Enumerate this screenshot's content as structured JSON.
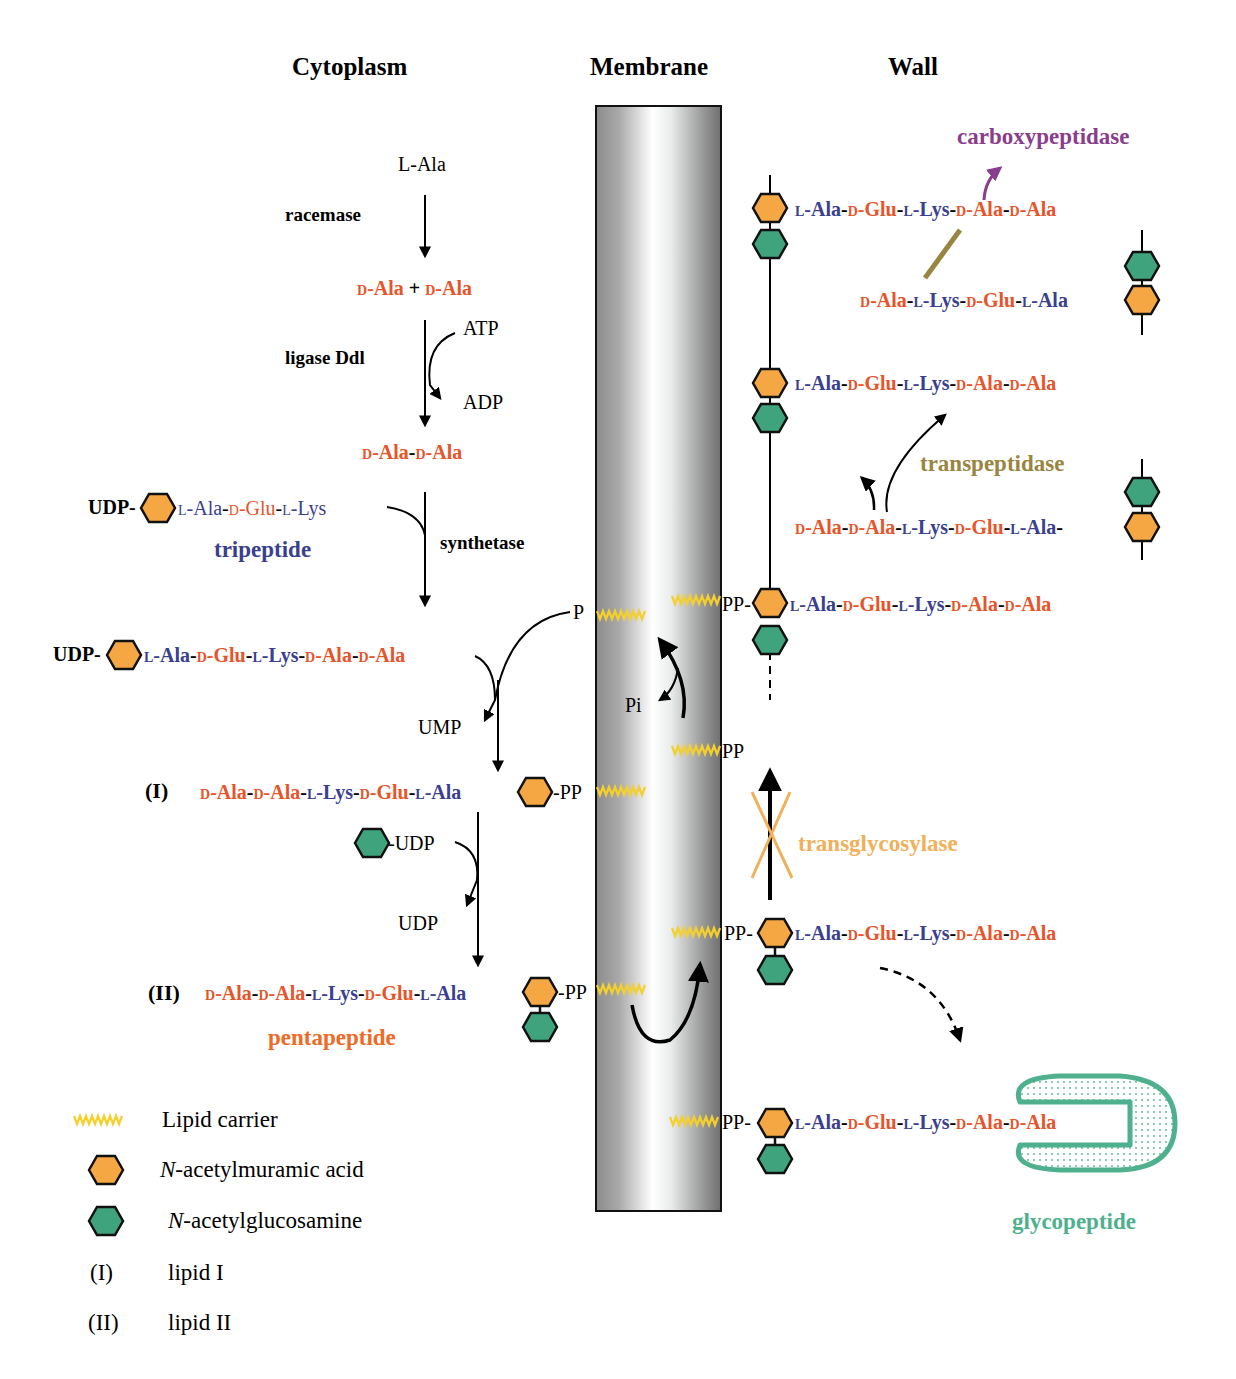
{
  "colors": {
    "d_residue": "#e8542a",
    "l_residue": "#3a3f8f",
    "murnac_fill": "#f4a742",
    "glcnac_fill": "#3fa47d",
    "lipid_carrier": "#f5d02a",
    "carboxypeptidase": "#8a3d8c",
    "transpeptidase": "#9a8540",
    "transglycosylase": "#f1b05a",
    "glycopeptide": "#4fb08d",
    "pentapeptide_label": "#ef6a26",
    "tripeptide_label": "#3a3f8f"
  },
  "headers": {
    "cytoplasm": "Cytoplasm",
    "membrane": "Membrane",
    "wall": "Wall"
  },
  "cytoplasm": {
    "l_ala": "L-Ala",
    "racemase": "racemase",
    "d_ala_plus": "D-Ala + D-Ala",
    "ligase": "ligase Ddl",
    "atp": "ATP",
    "adp": "ADP",
    "dipeptide": "D-Ala-D-Ala",
    "udp_tripeptide_prefix": "UDP-",
    "udp_tripeptide": "L-Ala-D-Glu-L-Lys",
    "tripeptide_label": "tripeptide",
    "synthetase": "synthetase",
    "udp_pentapeptide_prefix": "UDP-",
    "udp_pentapeptide": "L-Ala-D-Glu-L-Lys-D-Ala-D-Ala",
    "p_label": "P",
    "ump": "UMP",
    "lipid1_marker": "(I)",
    "lipid1_chain": "D-Ala-D-Ala-L-Lys-D-Glu-L-Ala",
    "lipid1_pp": "-PP",
    "glcnac_udp": "-UDP",
    "udp_release": "UDP",
    "lipid2_marker": "(II)",
    "lipid2_chain": "D-Ala-D-Ala-L-Lys-D-Glu-L-Ala",
    "lipid2_pp": "-PP",
    "pentapeptide_label": "pentapeptide"
  },
  "membrane": {
    "pi": "Pi",
    "pp_upper": "PP-",
    "pp_middle": "PP",
    "pp_lower": "PP-",
    "pp_bottom": "PP-"
  },
  "wall": {
    "carboxypeptidase": "carboxypeptidase",
    "chain1": "L-Ala-D-Glu-L-Lys-D-Ala-D-Ala",
    "chain2": "D-Ala-L-Lys-D-Glu-L-Ala",
    "chain3": "L-Ala-D-Glu-L-Lys-D-Ala-D-Ala",
    "transpeptidase": "transpeptidase",
    "chain4": "D-Ala-D-Ala-L-Lys-D-Glu-L-Ala-",
    "chain5": "L-Ala-D-Glu-L-Lys-D-Ala-D-Ala",
    "transglycosylase": "transglycosylase",
    "chain6": "L-Ala-D-Glu-L-Lys-D-Ala-D-Ala",
    "chain7": "L-Ala-D-Glu-L-Lys-D-Ala-D-Ala",
    "glycopeptide": "glycopeptide"
  },
  "legend": {
    "items": [
      {
        "symbol": "lipid-carrier-zigzag",
        "label": "Lipid carrier"
      },
      {
        "symbol": "murnac-hexagon",
        "label_italic": "N",
        "label": "-acetylmuramic acid"
      },
      {
        "symbol": "glcnac-hexagon",
        "label_italic": "N",
        "label": "-acetylglucosamine"
      },
      {
        "symbol": "(I)",
        "label": "lipid I"
      },
      {
        "symbol": "(II)",
        "label": "lipid II"
      }
    ]
  }
}
